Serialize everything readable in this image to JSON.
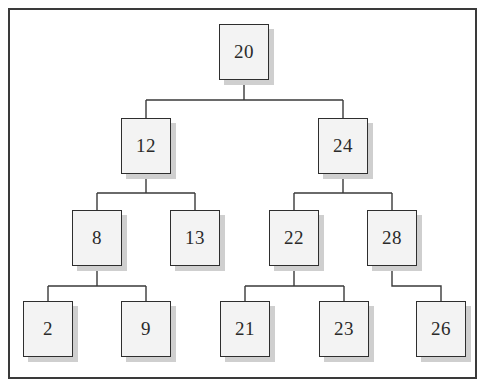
{
  "diagram": {
    "type": "binary-search-tree",
    "nodes": [
      {
        "id": "n20",
        "label": "20",
        "x": 219,
        "y": 24,
        "parent": null
      },
      {
        "id": "n12",
        "label": "12",
        "x": 121,
        "y": 118,
        "parent": "n20"
      },
      {
        "id": "n24",
        "label": "24",
        "x": 318,
        "y": 118,
        "parent": "n20"
      },
      {
        "id": "n8",
        "label": "8",
        "x": 72,
        "y": 210,
        "parent": "n12"
      },
      {
        "id": "n13",
        "label": "13",
        "x": 170,
        "y": 210,
        "parent": "n12"
      },
      {
        "id": "n22",
        "label": "22",
        "x": 269,
        "y": 210,
        "parent": "n24"
      },
      {
        "id": "n28",
        "label": "28",
        "x": 367,
        "y": 210,
        "parent": "n24"
      },
      {
        "id": "n2",
        "label": "2",
        "x": 23,
        "y": 301,
        "parent": "n8"
      },
      {
        "id": "n9",
        "label": "9",
        "x": 121,
        "y": 301,
        "parent": "n8"
      },
      {
        "id": "n21",
        "label": "21",
        "x": 220,
        "y": 301,
        "parent": "n22"
      },
      {
        "id": "n23",
        "label": "23",
        "x": 319,
        "y": 301,
        "parent": "n22"
      },
      {
        "id": "n26",
        "label": "26",
        "x": 416,
        "y": 301,
        "parent": "n28"
      }
    ],
    "colors": {
      "node_fill": "#f3f3f3",
      "node_border": "#2e2e2e",
      "node_shadow": "#cfcfcf",
      "connector": "#3a3a3a",
      "frame": "#3a3a3a",
      "text": "#2a2a2a"
    }
  }
}
